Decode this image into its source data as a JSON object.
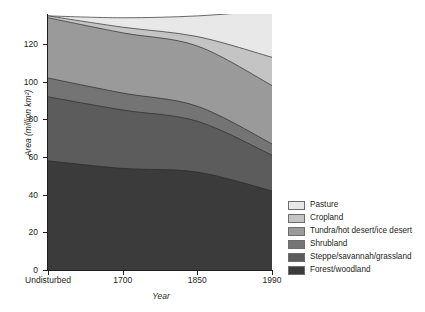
{
  "chart_data": {
    "type": "area",
    "stacked": true,
    "title": "",
    "xlabel": "Year",
    "ylabel": "Area (million km²)",
    "categories": [
      "Undisturbed",
      "1700",
      "1850",
      "1990"
    ],
    "x_tick_labels": [
      "Undisturbed",
      "1700",
      "1850",
      "1990"
    ],
    "y_tick_labels": [
      "0",
      "20",
      "40",
      "60",
      "80",
      "100",
      "120"
    ],
    "y_ticks": [
      0,
      20,
      40,
      60,
      80,
      100,
      120
    ],
    "ylim": [
      0,
      136
    ],
    "xlim": [
      0,
      3
    ],
    "grid": false,
    "legend_position": "right",
    "series": [
      {
        "name": "Forest/woodland",
        "color": "#3b3b3b",
        "values": [
          58,
          54,
          52,
          42
        ]
      },
      {
        "name": "Steppe/savannah/grassland",
        "color": "#5c5c5c",
        "values": [
          34,
          31,
          27,
          19
        ]
      },
      {
        "name": "Shrubland",
        "color": "#747474",
        "values": [
          10,
          9,
          8,
          6
        ]
      },
      {
        "name": "Tundra/hot desert/ice desert",
        "color": "#9a9a9a",
        "values": [
          32,
          32,
          32,
          31
        ]
      },
      {
        "name": "Cropland",
        "color": "#c4c4c4",
        "values": [
          1,
          3,
          5,
          15
        ]
      },
      {
        "name": "Pasture",
        "color": "#e8e8e8",
        "values": [
          0,
          5,
          11,
          25
        ]
      }
    ],
    "legend_entries_top_to_bottom": [
      {
        "label": "Pasture",
        "color": "#e8e8e8"
      },
      {
        "label": "Cropland",
        "color": "#c4c4c4"
      },
      {
        "label": "Tundra/hot desert/ice desert",
        "color": "#9a9a9a"
      },
      {
        "label": "Shrubland",
        "color": "#747474"
      },
      {
        "label": "Steppe/savannah/grassland",
        "color": "#5c5c5c"
      },
      {
        "label": "Forest/woodland",
        "color": "#3b3b3b"
      }
    ],
    "cumulative_tops": {
      "Forest/woodland": [
        58,
        54,
        52,
        42
      ],
      "Steppe/savannah/grassland": [
        92,
        85,
        79,
        61
      ],
      "Shrubland": [
        102,
        94,
        87,
        67
      ],
      "Tundra/hot desert/ice desert": [
        134,
        126,
        119,
        98
      ],
      "Cropland": [
        135,
        129,
        124,
        113
      ],
      "Pasture": [
        135,
        134,
        135,
        138
      ]
    }
  },
  "axis": {
    "y_title": "Area (million km²)",
    "x_title": "Year"
  }
}
